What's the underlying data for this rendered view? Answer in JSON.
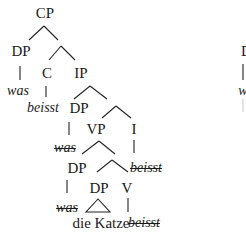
{
  "tree": {
    "nodes": {
      "cp": "CP",
      "dp_spec": "DP",
      "was_moved": "was",
      "c": "C",
      "beisst_moved": "beisst",
      "ip": "IP",
      "dp_subj": "DP",
      "was_trace1": "was",
      "vp": "VP",
      "i": "I",
      "beisst_trace1": "beisst",
      "dp_inner": "DP",
      "dp_obj": "DP",
      "v": "V",
      "was_trace2": "was",
      "die_katze": "die Katze",
      "beisst_trace2": "beisst"
    },
    "right_partial": {
      "dp": "D",
      "was": "was"
    }
  }
}
